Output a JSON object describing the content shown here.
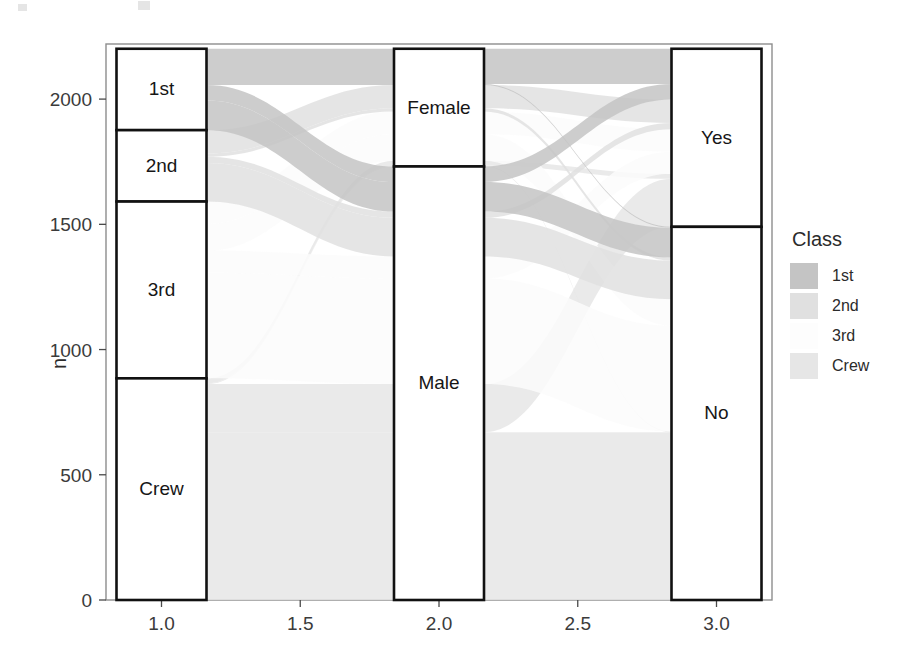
{
  "figure": {
    "width": 908,
    "height": 668,
    "background": "#ffffff"
  },
  "axes": {
    "y": {
      "title": "n",
      "ticks": [
        0,
        500,
        1000,
        1500,
        2000
      ],
      "tick_labels": [
        "0",
        "500",
        "1000",
        "1500",
        "2000"
      ],
      "limits": [
        0,
        2220
      ]
    },
    "x": {
      "title": "",
      "ticks": [
        1.0,
        1.5,
        2.0,
        2.5,
        3.0
      ],
      "tick_labels": [
        "1.0",
        "1.5",
        "2.0",
        "2.5",
        "3.0"
      ],
      "limits": [
        0.8,
        3.2
      ]
    }
  },
  "legend": {
    "title": "Class",
    "position": "right",
    "entries": [
      {
        "label": "1st",
        "color": "#c4c4c4"
      },
      {
        "label": "2nd",
        "color": "#e0e0e0"
      },
      {
        "label": "3rd",
        "color": "#fbfbfb"
      },
      {
        "label": "Crew",
        "color": "#e6e6e6"
      }
    ]
  },
  "strata": {
    "axis1": {
      "name": "Class",
      "x": 1.0,
      "items": [
        {
          "label": "1st",
          "value": 325
        },
        {
          "label": "2nd",
          "value": 285
        },
        {
          "label": "3rd",
          "value": 706
        },
        {
          "label": "Crew",
          "value": 885
        }
      ]
    },
    "axis2": {
      "name": "Sex",
      "x": 2.0,
      "items": [
        {
          "label": "Female",
          "value": 470
        },
        {
          "label": "Male",
          "value": 1731
        }
      ]
    },
    "axis3": {
      "name": "Survived",
      "x": 3.0,
      "items": [
        {
          "label": "Yes",
          "value": 711
        },
        {
          "label": "No",
          "value": 1490
        }
      ]
    }
  },
  "chart_data": {
    "type": "alluvial",
    "title": "",
    "xlabel": "",
    "ylabel": "n",
    "xlim": [
      0.8,
      3.2
    ],
    "ylim": [
      0,
      2220
    ],
    "x_ticks": [
      1.0,
      1.5,
      2.0,
      2.5,
      3.0
    ],
    "y_ticks": [
      0,
      500,
      1000,
      1500,
      2000
    ],
    "grid": false,
    "legend_title": "Class",
    "legend_position": "right",
    "axis_names": [
      "Class",
      "Sex",
      "Survived"
    ],
    "fill_variable": "Class",
    "categories": {
      "Class": [
        "1st",
        "2nd",
        "3rd",
        "Crew"
      ],
      "Sex": [
        "Female",
        "Male"
      ],
      "Survived": [
        "Yes",
        "No"
      ]
    },
    "stratum_totals": {
      "Class": {
        "1st": 325,
        "2nd": 285,
        "3rd": 706,
        "Crew": 885
      },
      "Sex": {
        "Female": 470,
        "Male": 1731
      },
      "Survived": {
        "Yes": 711,
        "No": 1490
      }
    },
    "total_n": 2201,
    "alluvia": [
      {
        "Class": "1st",
        "Sex": "Female",
        "Survived": "Yes",
        "n": 141
      },
      {
        "Class": "1st",
        "Sex": "Female",
        "Survived": "No",
        "n": 4
      },
      {
        "Class": "1st",
        "Sex": "Male",
        "Survived": "Yes",
        "n": 62
      },
      {
        "Class": "1st",
        "Sex": "Male",
        "Survived": "No",
        "n": 118
      },
      {
        "Class": "2nd",
        "Sex": "Female",
        "Survived": "Yes",
        "n": 93
      },
      {
        "Class": "2nd",
        "Sex": "Female",
        "Survived": "No",
        "n": 13
      },
      {
        "Class": "2nd",
        "Sex": "Male",
        "Survived": "Yes",
        "n": 25
      },
      {
        "Class": "2nd",
        "Sex": "Male",
        "Survived": "No",
        "n": 154
      },
      {
        "Class": "3rd",
        "Sex": "Female",
        "Survived": "Yes",
        "n": 90
      },
      {
        "Class": "3rd",
        "Sex": "Female",
        "Survived": "No",
        "n": 106
      },
      {
        "Class": "3rd",
        "Sex": "Male",
        "Survived": "Yes",
        "n": 88
      },
      {
        "Class": "3rd",
        "Sex": "Male",
        "Survived": "No",
        "n": 422
      },
      {
        "Class": "Crew",
        "Sex": "Female",
        "Survived": "Yes",
        "n": 20
      },
      {
        "Class": "Crew",
        "Sex": "Female",
        "Survived": "No",
        "n": 3
      },
      {
        "Class": "Crew",
        "Sex": "Male",
        "Survived": "Yes",
        "n": 192
      },
      {
        "Class": "Crew",
        "Sex": "Male",
        "Survived": "No",
        "n": 670
      }
    ],
    "class_colors": {
      "1st": "#c4c4c4",
      "2nd": "#e0e0e0",
      "3rd": "#fbfbfb",
      "Crew": "#e6e6e6"
    }
  }
}
